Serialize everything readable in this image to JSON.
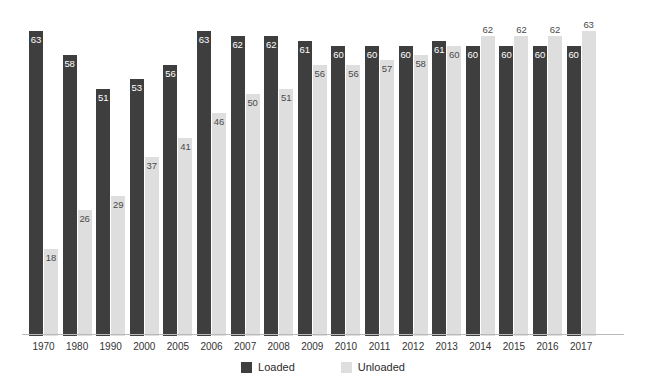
{
  "chart_data": {
    "type": "bar",
    "title": "",
    "subtitle": "",
    "xlabel": "",
    "ylabel": "",
    "ylim": [
      0,
      69
    ],
    "grid": false,
    "legend_position": "bottom-center",
    "categories": [
      "1970",
      "1980",
      "1990",
      "2000",
      "2005",
      "2006",
      "2007",
      "2008",
      "2009",
      "2010",
      "2011",
      "2012",
      "2013",
      "2014",
      "2015",
      "2016",
      "2017"
    ],
    "series": [
      {
        "name": "Loaded",
        "color": "#3e3e3e",
        "values": [
          63,
          58,
          51,
          53,
          56,
          63,
          62,
          62,
          61,
          60,
          60,
          60,
          61,
          60,
          60,
          60,
          60
        ]
      },
      {
        "name": "Unloaded",
        "color": "#dedede",
        "values": [
          18,
          26,
          29,
          37,
          41,
          46,
          50,
          51,
          56,
          56,
          57,
          58,
          60,
          62,
          62,
          62,
          63
        ]
      }
    ]
  },
  "legend": {
    "items": [
      {
        "label": "Loaded",
        "color": "#3e3e3e"
      },
      {
        "label": "Unloaded",
        "color": "#dedede"
      }
    ]
  },
  "colors": {
    "loaded": "#3e3e3e",
    "unloaded": "#dedede",
    "axis": "#b9b9b9",
    "background": "#ffffff",
    "label_on_dark": "#ffffff",
    "label_on_light": "#4a4a4a"
  }
}
